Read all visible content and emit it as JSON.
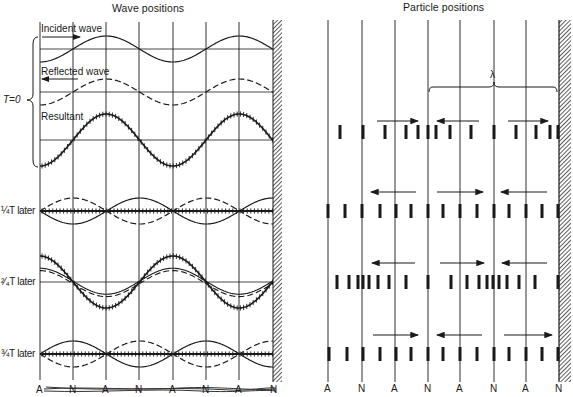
{
  "figure": {
    "left_title": "Wave positions",
    "right_title": "Particle positions",
    "t0_label": "T=0",
    "incident_label": "Incident wave",
    "reflected_label": "Reflected wave",
    "resultant_label": "Resultant",
    "row_labels": [
      "¼T later",
      "²⁄₄T later",
      "¾T later"
    ],
    "row_labels_display": [
      "¼T later",
      "²⁄₄T later",
      "¾T later"
    ],
    "lambda_label": "λ",
    "node_antinode_labels": [
      "A",
      "N",
      "A",
      "N",
      "A",
      "N",
      "A",
      "N"
    ],
    "colors": {
      "ink": "#1a1a1a",
      "paper": "#ffffff",
      "wall": "#555555"
    }
  },
  "chart_data": {
    "type": "diagram",
    "panels": [
      {
        "name": "Wave positions",
        "rows": [
          {
            "time": "T=0",
            "curves": [
              "Incident wave (solid, moving right)",
              "Reflected wave (dashed, moving left)",
              "Resultant (crossed line)"
            ]
          },
          {
            "time": "1/4 T later",
            "curves": [
              "incident",
              "reflected",
              "resultant = flat (zero displacement)"
            ]
          },
          {
            "time": "2/4 T later",
            "curves": [
              "incident",
              "reflected",
              "resultant = max amplitude"
            ]
          },
          {
            "time": "3/4 T later",
            "curves": [
              "incident",
              "reflected",
              "resultant = flat"
            ]
          }
        ],
        "x_markers": [
          "A",
          "N",
          "A",
          "N",
          "A",
          "N",
          "A",
          "N"
        ]
      },
      {
        "name": "Particle positions",
        "rows": [
          "T=0",
          "1/4 T later",
          "2/4 T later",
          "3/4 T later"
        ],
        "annotation": "λ spans from the second N to the wall N",
        "x_markers": [
          "A",
          "N",
          "A",
          "N",
          "A",
          "N",
          "A",
          "N"
        ]
      }
    ]
  }
}
